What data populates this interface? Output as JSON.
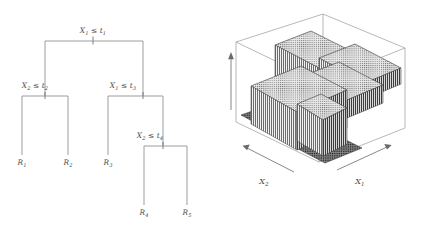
{
  "figure": {
    "name": "regression-tree-and-partition-surface",
    "background": "#ffffff",
    "ink": "#555555",
    "line_color": "#8d8d8d"
  },
  "tree": {
    "nodes": [
      {
        "id": "root",
        "label_var": "X",
        "label_sub": "1",
        "label_op": "≤",
        "label_thr": "t",
        "label_thr_sub": "1",
        "text": "X₁ ≤ t₁",
        "x": 93,
        "y": 33
      },
      {
        "id": "n2",
        "label_var": "X",
        "label_sub": "2",
        "label_op": "≤",
        "label_thr": "t",
        "label_thr_sub": "2",
        "text": "X₂ ≤ t₂",
        "x": 35,
        "y": 88
      },
      {
        "id": "n3",
        "label_var": "X",
        "label_sub": "1",
        "label_op": "≤",
        "label_thr": "t",
        "label_thr_sub": "3",
        "text": "X₁ ≤ t₃",
        "x": 123,
        "y": 88
      },
      {
        "id": "n4",
        "label_var": "X",
        "label_sub": "2",
        "label_op": "≤",
        "label_thr": "t",
        "label_thr_sub": "4",
        "text": "X₂ ≤ t₄",
        "x": 150,
        "y": 138
      }
    ],
    "leaves": [
      {
        "id": "R1",
        "label_var": "R",
        "label_sub": "1",
        "text": "R₁",
        "x": 18,
        "y": 163
      },
      {
        "id": "R2",
        "label_var": "R",
        "label_sub": "2",
        "text": "R₂",
        "x": 63,
        "y": 163
      },
      {
        "id": "R3",
        "label_var": "R",
        "label_sub": "3",
        "text": "R₃",
        "x": 104,
        "y": 163
      },
      {
        "id": "R4",
        "label_var": "R",
        "label_sub": "4",
        "text": "R₄",
        "x": 140,
        "y": 213
      },
      {
        "id": "R5",
        "label_var": "R",
        "label_sub": "5",
        "text": "R₅",
        "x": 183,
        "y": 213
      }
    ],
    "split_count": 4,
    "region_count": 5
  },
  "surface": {
    "axes": [
      {
        "id": "x1",
        "label_var": "X",
        "label_sub": "1",
        "text": "X₁",
        "x": 360,
        "y": 182,
        "direction": "right"
      },
      {
        "id": "x2",
        "label_var": "X",
        "label_sub": "2",
        "text": "X₂",
        "x": 264,
        "y": 182,
        "direction": "left"
      },
      {
        "id": "y",
        "label_var": "",
        "label_sub": "",
        "text": "",
        "x": 232,
        "y": 100,
        "direction": "up"
      }
    ],
    "regions": [
      {
        "id": "R1",
        "height_level": "low"
      },
      {
        "id": "R2",
        "height_level": "low"
      },
      {
        "id": "R3",
        "height_level": "high"
      },
      {
        "id": "R4",
        "height_level": "medium"
      },
      {
        "id": "R5",
        "height_level": "medium"
      }
    ],
    "type": "piecewise-constant-3d-surface"
  }
}
